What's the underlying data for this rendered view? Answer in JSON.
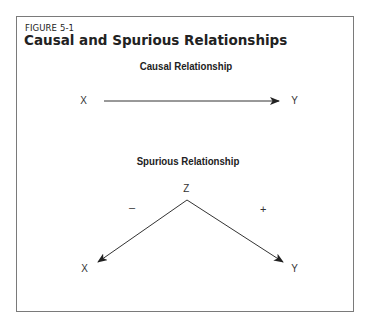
{
  "figure": {
    "label": "FIGURE 5-1",
    "title": "Causal and Spurious Relationships"
  },
  "causal": {
    "title": "Causal Relationship",
    "from": "X",
    "to": "Y"
  },
  "spurious": {
    "title": "Spurious Relationship",
    "common_cause": "Z",
    "left_node": "X",
    "right_node": "Y",
    "left_sign": "–",
    "right_sign": "+"
  },
  "colors": {
    "border": "#7a7a7a",
    "text": "#222222",
    "lines": "#333333"
  }
}
